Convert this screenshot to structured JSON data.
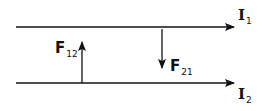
{
  "diagram": {
    "wire_top": {
      "current_symbol": "I",
      "current_subscript": "1"
    },
    "wire_bottom": {
      "current_symbol": "I",
      "current_subscript": "2"
    },
    "force_12": {
      "symbol": "F",
      "subscript": "12",
      "direction": "up"
    },
    "force_21": {
      "symbol": "F",
      "subscript": "21",
      "direction": "down"
    },
    "colors": {
      "stroke": "#111111",
      "background": "#ffffff"
    }
  }
}
